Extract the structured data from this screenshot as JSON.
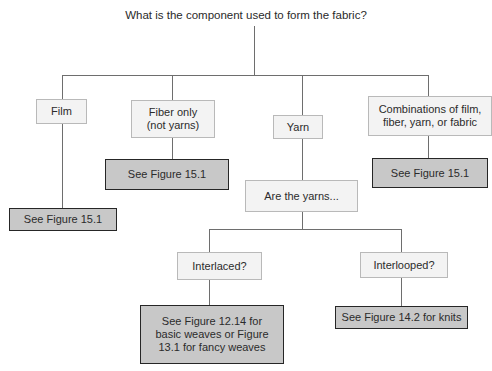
{
  "diagram": {
    "title": "What is the component used to form the fabric?",
    "nodes": {
      "film": "Film",
      "fiber": "Fiber only\n(not yarns)",
      "yarn": "Yarn",
      "combinations": "Combinations of film,\nfiber, yarn, or fabric",
      "film_ref": "See Figure 15.1",
      "fiber_ref": "See Figure 15.1",
      "combinations_ref": "See Figure 15.1",
      "are_yarns": "Are the yarns...",
      "interlaced": "Interlaced?",
      "interlooped": "Interlooped?",
      "interlaced_ref": "See Figure 12.14 for\nbasic weaves or Figure\n13.1 for fancy weaves",
      "interlooped_ref": "See Figure 14.2 for knits"
    },
    "colors": {
      "question_fill": "#f3f3f3",
      "answer_fill": "#c8c8c8",
      "connector": "#6e6e6e"
    }
  }
}
